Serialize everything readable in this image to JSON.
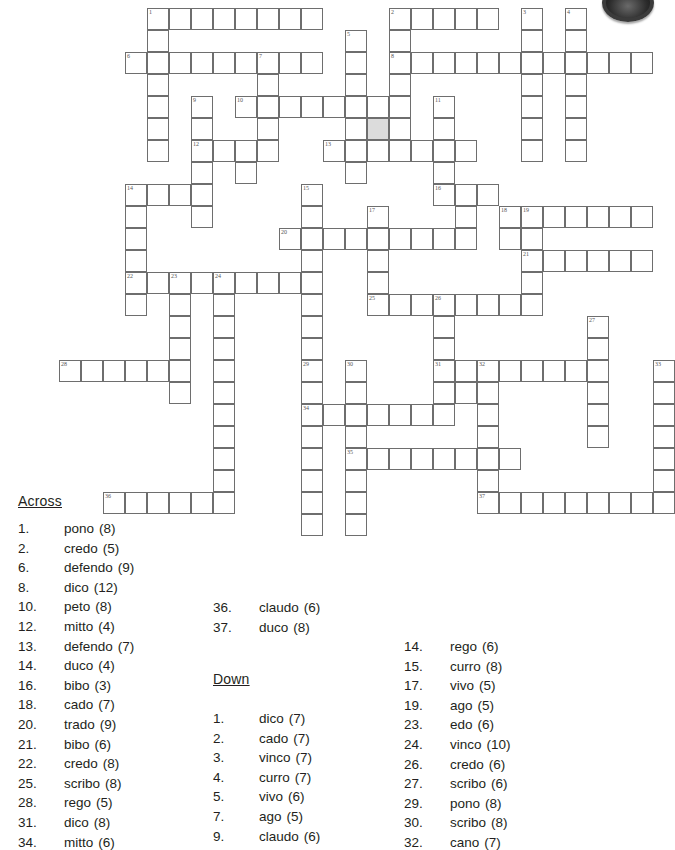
{
  "meta": {
    "document_type": "crossword-puzzle-worksheet",
    "logo": "circle-logo-mark"
  },
  "grid": {
    "cell_px": 22,
    "origin_x": 147,
    "origin_y": 8,
    "shaded_cell": {
      "col": 10,
      "row": 5,
      "color": "#dcdcdc"
    },
    "cells": [
      {
        "c": 0,
        "r": 0,
        "n": "1"
      },
      {
        "c": 1,
        "r": 0
      },
      {
        "c": 2,
        "r": 0
      },
      {
        "c": 3,
        "r": 0
      },
      {
        "c": 4,
        "r": 0
      },
      {
        "c": 5,
        "r": 0
      },
      {
        "c": 6,
        "r": 0
      },
      {
        "c": 7,
        "r": 0
      },
      {
        "c": 11,
        "r": 0,
        "n": "2"
      },
      {
        "c": 12,
        "r": 0
      },
      {
        "c": 13,
        "r": 0
      },
      {
        "c": 14,
        "r": 0
      },
      {
        "c": 15,
        "r": 0
      },
      {
        "c": 17,
        "r": 0,
        "n": "3"
      },
      {
        "c": 19,
        "r": 0,
        "n": "4"
      },
      {
        "c": 0,
        "r": 1
      },
      {
        "c": 11,
        "r": 1
      },
      {
        "c": 17,
        "r": 1
      },
      {
        "c": 19,
        "r": 1
      },
      {
        "c": 9,
        "r": 1,
        "n": "5"
      },
      {
        "c": -1,
        "r": 2,
        "n": "6"
      },
      {
        "c": 0,
        "r": 2
      },
      {
        "c": 1,
        "r": 2
      },
      {
        "c": 2,
        "r": 2
      },
      {
        "c": 3,
        "r": 2
      },
      {
        "c": 4,
        "r": 2
      },
      {
        "c": 5,
        "r": 2,
        "n": "7"
      },
      {
        "c": 6,
        "r": 2
      },
      {
        "c": 7,
        "r": 2
      },
      {
        "c": 9,
        "r": 2
      },
      {
        "c": 11,
        "r": 2,
        "n": "8"
      },
      {
        "c": 12,
        "r": 2
      },
      {
        "c": 13,
        "r": 2
      },
      {
        "c": 14,
        "r": 2
      },
      {
        "c": 15,
        "r": 2
      },
      {
        "c": 16,
        "r": 2
      },
      {
        "c": 17,
        "r": 2
      },
      {
        "c": 18,
        "r": 2
      },
      {
        "c": 19,
        "r": 2
      },
      {
        "c": 20,
        "r": 2
      },
      {
        "c": 21,
        "r": 2
      },
      {
        "c": 22,
        "r": 2
      },
      {
        "c": 0,
        "r": 3
      },
      {
        "c": 5,
        "r": 3
      },
      {
        "c": 9,
        "r": 3
      },
      {
        "c": 11,
        "r": 3
      },
      {
        "c": 17,
        "r": 3
      },
      {
        "c": 19,
        "r": 3
      },
      {
        "c": 0,
        "r": 4
      },
      {
        "c": 2,
        "r": 4,
        "n": "9"
      },
      {
        "c": 4,
        "r": 4,
        "n": "10"
      },
      {
        "c": 5,
        "r": 4
      },
      {
        "c": 6,
        "r": 4
      },
      {
        "c": 7,
        "r": 4
      },
      {
        "c": 8,
        "r": 4
      },
      {
        "c": 9,
        "r": 4
      },
      {
        "c": 10,
        "r": 4
      },
      {
        "c": 11,
        "r": 4
      },
      {
        "c": 13,
        "r": 4,
        "n": "11"
      },
      {
        "c": 17,
        "r": 4
      },
      {
        "c": 19,
        "r": 4
      },
      {
        "c": 0,
        "r": 5
      },
      {
        "c": 2,
        "r": 5
      },
      {
        "c": 5,
        "r": 5
      },
      {
        "c": 9,
        "r": 5
      },
      {
        "c": 10,
        "r": 5,
        "shaded": true
      },
      {
        "c": 11,
        "r": 5
      },
      {
        "c": 13,
        "r": 5
      },
      {
        "c": 17,
        "r": 5
      },
      {
        "c": 19,
        "r": 5
      },
      {
        "c": 0,
        "r": 6
      },
      {
        "c": 2,
        "r": 6,
        "n": "12"
      },
      {
        "c": 3,
        "r": 6
      },
      {
        "c": 4,
        "r": 6
      },
      {
        "c": 5,
        "r": 6
      },
      {
        "c": 8,
        "r": 6,
        "n": "13"
      },
      {
        "c": 9,
        "r": 6
      },
      {
        "c": 10,
        "r": 6
      },
      {
        "c": 11,
        "r": 6
      },
      {
        "c": 12,
        "r": 6
      },
      {
        "c": 13,
        "r": 6
      },
      {
        "c": 14,
        "r": 6
      },
      {
        "c": 17,
        "r": 6
      },
      {
        "c": 19,
        "r": 6
      },
      {
        "c": 2,
        "r": 7
      },
      {
        "c": 4,
        "r": 7
      },
      {
        "c": 9,
        "r": 7
      },
      {
        "c": 13,
        "r": 7
      },
      {
        "c": -1,
        "r": 8,
        "n": "14"
      },
      {
        "c": 0,
        "r": 8
      },
      {
        "c": 1,
        "r": 8
      },
      {
        "c": 2,
        "r": 8
      },
      {
        "c": 7,
        "r": 8,
        "n": "15"
      },
      {
        "c": 13,
        "r": 8,
        "n": "16"
      },
      {
        "c": 14,
        "r": 8
      },
      {
        "c": 15,
        "r": 8
      },
      {
        "c": -1,
        "r": 9
      },
      {
        "c": 2,
        "r": 9
      },
      {
        "c": 7,
        "r": 9
      },
      {
        "c": 10,
        "r": 9,
        "n": "17"
      },
      {
        "c": 14,
        "r": 9
      },
      {
        "c": 16,
        "r": 9,
        "n": "18"
      },
      {
        "c": 17,
        "r": 9,
        "n": "19"
      },
      {
        "c": 18,
        "r": 9
      },
      {
        "c": 19,
        "r": 9
      },
      {
        "c": 20,
        "r": 9
      },
      {
        "c": 21,
        "r": 9
      },
      {
        "c": 22,
        "r": 9
      },
      {
        "c": -1,
        "r": 10
      },
      {
        "c": 6,
        "r": 10,
        "n": "20"
      },
      {
        "c": 7,
        "r": 10
      },
      {
        "c": 8,
        "r": 10
      },
      {
        "c": 9,
        "r": 10
      },
      {
        "c": 10,
        "r": 10
      },
      {
        "c": 11,
        "r": 10
      },
      {
        "c": 12,
        "r": 10
      },
      {
        "c": 13,
        "r": 10
      },
      {
        "c": 14,
        "r": 10
      },
      {
        "c": 16,
        "r": 10
      },
      {
        "c": 17,
        "r": 10
      },
      {
        "c": -1,
        "r": 11
      },
      {
        "c": 7,
        "r": 11
      },
      {
        "c": 10,
        "r": 11
      },
      {
        "c": 17,
        "r": 11,
        "n": "21"
      },
      {
        "c": 18,
        "r": 11
      },
      {
        "c": 19,
        "r": 11
      },
      {
        "c": 20,
        "r": 11
      },
      {
        "c": 21,
        "r": 11
      },
      {
        "c": 22,
        "r": 11
      },
      {
        "c": -1,
        "r": 12,
        "n": "22"
      },
      {
        "c": 0,
        "r": 12
      },
      {
        "c": 1,
        "r": 12,
        "n": "23"
      },
      {
        "c": 2,
        "r": 12
      },
      {
        "c": 3,
        "r": 12,
        "n": "24"
      },
      {
        "c": 4,
        "r": 12
      },
      {
        "c": 5,
        "r": 12
      },
      {
        "c": 6,
        "r": 12
      },
      {
        "c": 7,
        "r": 12
      },
      {
        "c": 10,
        "r": 12
      },
      {
        "c": 17,
        "r": 12
      },
      {
        "c": -1,
        "r": 13
      },
      {
        "c": 1,
        "r": 13
      },
      {
        "c": 3,
        "r": 13
      },
      {
        "c": 7,
        "r": 13
      },
      {
        "c": 10,
        "r": 13,
        "n": "25"
      },
      {
        "c": 11,
        "r": 13
      },
      {
        "c": 12,
        "r": 13
      },
      {
        "c": 13,
        "r": 13,
        "n": "26"
      },
      {
        "c": 14,
        "r": 13
      },
      {
        "c": 15,
        "r": 13
      },
      {
        "c": 16,
        "r": 13
      },
      {
        "c": 17,
        "r": 13
      },
      {
        "c": 1,
        "r": 14
      },
      {
        "c": 3,
        "r": 14
      },
      {
        "c": 7,
        "r": 14
      },
      {
        "c": 13,
        "r": 14
      },
      {
        "c": 20,
        "r": 14,
        "n": "27"
      },
      {
        "c": 1,
        "r": 15
      },
      {
        "c": 3,
        "r": 15
      },
      {
        "c": 7,
        "r": 15
      },
      {
        "c": 13,
        "r": 15
      },
      {
        "c": 20,
        "r": 15
      },
      {
        "c": -4,
        "r": 16,
        "n": "28"
      },
      {
        "c": -3,
        "r": 16
      },
      {
        "c": -2,
        "r": 16
      },
      {
        "c": -1,
        "r": 16
      },
      {
        "c": 0,
        "r": 16
      },
      {
        "c": 1,
        "r": 16
      },
      {
        "c": 3,
        "r": 16
      },
      {
        "c": 7,
        "r": 16,
        "n": "29"
      },
      {
        "c": 9,
        "r": 16,
        "n": "30"
      },
      {
        "c": 13,
        "r": 16,
        "n": "31"
      },
      {
        "c": 14,
        "r": 16
      },
      {
        "c": 15,
        "r": 16,
        "n": "32"
      },
      {
        "c": 16,
        "r": 16
      },
      {
        "c": 17,
        "r": 16
      },
      {
        "c": 18,
        "r": 16
      },
      {
        "c": 19,
        "r": 16
      },
      {
        "c": 20,
        "r": 16
      },
      {
        "c": 23,
        "r": 16,
        "n": "33"
      },
      {
        "c": 1,
        "r": 17
      },
      {
        "c": 3,
        "r": 17
      },
      {
        "c": 7,
        "r": 17
      },
      {
        "c": 9,
        "r": 17
      },
      {
        "c": 13,
        "r": 17
      },
      {
        "c": 14,
        "r": 17
      },
      {
        "c": 15,
        "r": 17
      },
      {
        "c": 20,
        "r": 17
      },
      {
        "c": 23,
        "r": 17
      },
      {
        "c": 3,
        "r": 18
      },
      {
        "c": 7,
        "r": 18,
        "n": "34"
      },
      {
        "c": 8,
        "r": 18
      },
      {
        "c": 9,
        "r": 18
      },
      {
        "c": 10,
        "r": 18
      },
      {
        "c": 11,
        "r": 18
      },
      {
        "c": 12,
        "r": 18
      },
      {
        "c": 13,
        "r": 18
      },
      {
        "c": 15,
        "r": 18
      },
      {
        "c": 20,
        "r": 18
      },
      {
        "c": 23,
        "r": 18
      },
      {
        "c": 3,
        "r": 19
      },
      {
        "c": 7,
        "r": 19
      },
      {
        "c": 9,
        "r": 19
      },
      {
        "c": 15,
        "r": 19
      },
      {
        "c": 20,
        "r": 19
      },
      {
        "c": 23,
        "r": 19
      },
      {
        "c": 3,
        "r": 20
      },
      {
        "c": 7,
        "r": 20
      },
      {
        "c": 9,
        "r": 20,
        "n": "35"
      },
      {
        "c": 10,
        "r": 20
      },
      {
        "c": 11,
        "r": 20
      },
      {
        "c": 12,
        "r": 20
      },
      {
        "c": 13,
        "r": 20
      },
      {
        "c": 14,
        "r": 20
      },
      {
        "c": 15,
        "r": 20
      },
      {
        "c": 16,
        "r": 20
      },
      {
        "c": 23,
        "r": 20
      },
      {
        "c": 3,
        "r": 21
      },
      {
        "c": 7,
        "r": 21
      },
      {
        "c": 9,
        "r": 21
      },
      {
        "c": 15,
        "r": 21
      },
      {
        "c": 23,
        "r": 21
      },
      {
        "c": -2,
        "r": 22,
        "n": "36"
      },
      {
        "c": -1,
        "r": 22
      },
      {
        "c": 0,
        "r": 22
      },
      {
        "c": 1,
        "r": 22
      },
      {
        "c": 2,
        "r": 22
      },
      {
        "c": 3,
        "r": 22
      },
      {
        "c": 7,
        "r": 22
      },
      {
        "c": 9,
        "r": 22
      },
      {
        "c": 15,
        "r": 22,
        "n": "37"
      },
      {
        "c": 16,
        "r": 22
      },
      {
        "c": 17,
        "r": 22
      },
      {
        "c": 18,
        "r": 22
      },
      {
        "c": 19,
        "r": 22
      },
      {
        "c": 20,
        "r": 22
      },
      {
        "c": 21,
        "r": 22
      },
      {
        "c": 22,
        "r": 22
      },
      {
        "c": 23,
        "r": 22
      },
      {
        "c": 7,
        "r": 23
      },
      {
        "c": 9,
        "r": 23
      }
    ]
  },
  "clues": {
    "across_heading": "Across",
    "down_heading": "Down",
    "across": [
      {
        "num": "1.",
        "word": "pono",
        "len": "(8)"
      },
      {
        "num": "2.",
        "word": "credo",
        "len": "(5)"
      },
      {
        "num": "6.",
        "word": "defendo",
        "len": "(9)"
      },
      {
        "num": "8.",
        "word": "dico",
        "len": "(12)"
      },
      {
        "num": "10.",
        "word": "peto",
        "len": "(8)"
      },
      {
        "num": "12.",
        "word": "mitto",
        "len": "(4)"
      },
      {
        "num": "13.",
        "word": "defendo",
        "len": "(7)"
      },
      {
        "num": "14.",
        "word": "duco",
        "len": "(4)"
      },
      {
        "num": "16.",
        "word": "bibo",
        "len": "(3)"
      },
      {
        "num": "18.",
        "word": "cado",
        "len": "(7)"
      },
      {
        "num": "20.",
        "word": "trado",
        "len": "(9)"
      },
      {
        "num": "21.",
        "word": "bibo",
        "len": "(6)"
      },
      {
        "num": "22.",
        "word": "credo",
        "len": "(8)"
      },
      {
        "num": "25.",
        "word": "scribo",
        "len": "(8)"
      },
      {
        "num": "28.",
        "word": "rego",
        "len": "(5)"
      },
      {
        "num": "31.",
        "word": "dico",
        "len": "(8)"
      },
      {
        "num": "34.",
        "word": "mitto",
        "len": "(6)"
      }
    ],
    "across_col2": [
      {
        "num": "36.",
        "word": "claudo",
        "len": "(6)"
      },
      {
        "num": "37.",
        "word": "duco",
        "len": "(8)"
      }
    ],
    "down": [
      {
        "num": "1.",
        "word": "dico",
        "len": "(7)"
      },
      {
        "num": "2.",
        "word": "cado",
        "len": "(7)"
      },
      {
        "num": "3.",
        "word": "vinco",
        "len": "(7)"
      },
      {
        "num": "4.",
        "word": "curro",
        "len": "(7)"
      },
      {
        "num": "5.",
        "word": "vivo",
        "len": "(6)"
      },
      {
        "num": "7.",
        "word": "ago",
        "len": "(5)"
      },
      {
        "num": "9.",
        "word": "claudo",
        "len": "(6)"
      }
    ],
    "down_col2": [
      {
        "num": "14.",
        "word": "rego",
        "len": "(6)"
      },
      {
        "num": "15.",
        "word": "curro",
        "len": "(8)"
      },
      {
        "num": "17.",
        "word": "vivo",
        "len": "(5)"
      },
      {
        "num": "19.",
        "word": "ago",
        "len": "(5)"
      },
      {
        "num": "23.",
        "word": "edo",
        "len": "(6)"
      },
      {
        "num": "24.",
        "word": "vinco",
        "len": "(10)"
      },
      {
        "num": "26.",
        "word": "credo",
        "len": "(6)"
      },
      {
        "num": "27.",
        "word": "scribo",
        "len": "(6)"
      },
      {
        "num": "29.",
        "word": "pono",
        "len": "(8)"
      },
      {
        "num": "30.",
        "word": "scribo",
        "len": "(8)"
      },
      {
        "num": "32.",
        "word": "cano",
        "len": "(7)"
      }
    ]
  }
}
